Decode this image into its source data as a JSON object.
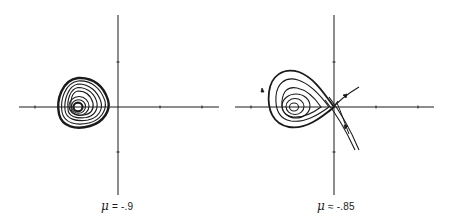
{
  "figure": {
    "panels": [
      {
        "id": "left",
        "mu_symbol": "μ",
        "relation": "=",
        "value": "-.9",
        "description": "Phase portrait: stable spiral/limit cycle nest left of origin"
      },
      {
        "id": "right",
        "mu_symbol": "μ",
        "relation": "≈",
        "value": "-.85",
        "description": "Phase portrait: nested cycles with saddle point at origin and separatrices"
      }
    ],
    "colors": {
      "ink": "#1a1a1a",
      "background": "#ffffff"
    }
  }
}
